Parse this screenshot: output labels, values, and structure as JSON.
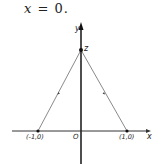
{
  "equation": {
    "lhs": "x",
    "op": "=",
    "rhs": "0."
  },
  "diagram": {
    "axes": {
      "x_label": "x",
      "y_label": "y",
      "origin_label": "O"
    },
    "points": [
      {
        "label": "z",
        "desc": "apex on y-axis"
      },
      {
        "label": "(-1,0)",
        "desc": "left point on x-axis"
      },
      {
        "label": "(1,0)",
        "desc": "right point on x-axis"
      }
    ],
    "segments": [
      {
        "from": "(-1,0)",
        "to": "z"
      },
      {
        "from": "(1,0)",
        "to": "z"
      }
    ],
    "colors": {
      "axis": "#222222",
      "segment": "#777777"
    }
  }
}
